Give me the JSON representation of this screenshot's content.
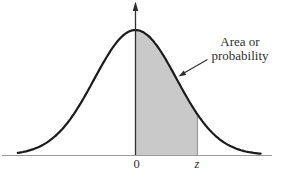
{
  "figure": {
    "annotation": {
      "line1": "Area or",
      "line2": "probability"
    },
    "axis_labels": {
      "zero": "0",
      "z": "z"
    },
    "colors": {
      "curve": "#1b1b1b",
      "shade": "#c9c9c9",
      "shade_edge": "#9c9c9c",
      "baseline": "#9a9a9a",
      "axis": "#2e2e2e",
      "text": "#2e2e2e"
    }
  },
  "chart_data": {
    "type": "area",
    "title": "",
    "xlabel": "",
    "ylabel": "",
    "distribution": "standard normal pdf",
    "mean": 0,
    "sigma": 1,
    "x_range": [
      -2.85,
      3.06
    ],
    "shaded_region": {
      "from": 0,
      "to": 1.5,
      "from_label": "0",
      "to_label": "z",
      "meaning": "Area or probability"
    },
    "xticks": [
      {
        "position": 0,
        "label": "0"
      },
      {
        "position": 1.5,
        "label": "z"
      }
    ],
    "annotations": [
      {
        "text": "Area or probability",
        "points_to": "curve at right edge of shaded region"
      }
    ],
    "grid": false,
    "legend": false,
    "y_axis_arrow": true
  }
}
